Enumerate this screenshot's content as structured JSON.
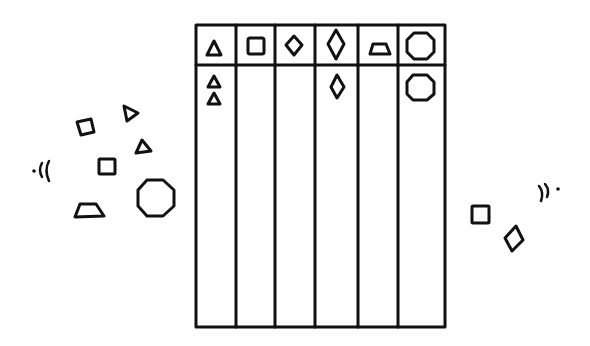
{
  "diagram": {
    "type": "sorting-chart",
    "columns": [
      {
        "header_shape": "triangle",
        "sorted_count": 2
      },
      {
        "header_shape": "square",
        "sorted_count": 0
      },
      {
        "header_shape": "small-diamond",
        "sorted_count": 0
      },
      {
        "header_shape": "tall-diamond",
        "sorted_count": 1
      },
      {
        "header_shape": "trapezoid",
        "sorted_count": 0
      },
      {
        "header_shape": "octagon",
        "sorted_count": 1
      }
    ],
    "left_loose_shapes": [
      "square",
      "triangle",
      "triangle",
      "square",
      "trapezoid",
      "octagon"
    ],
    "right_loose_shapes": [
      "square",
      "diamond"
    ],
    "left_sound_mark": "·((",
    "right_sound_mark": "))·",
    "colors": {
      "ink": "#111111",
      "background": "#ffffff"
    }
  }
}
